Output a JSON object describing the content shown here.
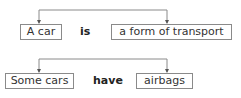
{
  "diagram": {
    "rows": [
      {
        "subject": "A car",
        "verb": "is",
        "object": "a form of transport"
      },
      {
        "subject": "Some cars",
        "verb": "have",
        "object": "airbags"
      }
    ],
    "line_color": "#8a8a8a"
  }
}
